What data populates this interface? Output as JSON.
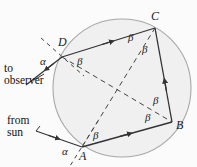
{
  "figure": {
    "background_color": "#fbfbfb",
    "circle": {
      "cx": 122,
      "cy": 88,
      "r": 69,
      "fill": "#f0f0f0",
      "stroke": "#a8a8a8"
    },
    "line_color": "#333333",
    "dash_color": "#444444"
  },
  "vertices": [
    {
      "id": "A",
      "label": "A",
      "x": 82,
      "y": 147
    },
    {
      "id": "B",
      "label": "B",
      "x": 172,
      "y": 122
    },
    {
      "id": "C",
      "label": "C",
      "x": 155,
      "y": 28
    },
    {
      "id": "D",
      "label": "D",
      "x": 62,
      "y": 57
    }
  ],
  "angle_labels": [
    {
      "id": "alpha-D",
      "text": "α",
      "x": 47,
      "y": 62
    },
    {
      "id": "beta-D",
      "text": "β",
      "x": 81,
      "y": 62
    },
    {
      "id": "beta-C-left",
      "text": "β",
      "x": 131,
      "y": 38
    },
    {
      "id": "beta-C-right",
      "text": "β",
      "x": 145,
      "y": 50
    },
    {
      "id": "beta-B-upper",
      "text": "β",
      "x": 156,
      "y": 101
    },
    {
      "id": "beta-B-lower",
      "text": "β",
      "x": 148,
      "y": 118
    },
    {
      "id": "beta-A",
      "text": "β",
      "x": 96,
      "y": 136
    },
    {
      "id": "alpha-A",
      "text": "α",
      "x": 66,
      "y": 152
    }
  ],
  "ray_labels": [
    {
      "id": "to-observer",
      "line1": "to",
      "line2": "observer",
      "x": 4,
      "y": 70
    },
    {
      "id": "from-sun",
      "line1": "from",
      "line2": "sun",
      "x": 12,
      "y": 122
    }
  ],
  "symbols": {
    "alpha": "α",
    "beta": "β"
  },
  "geometry": {
    "solid_sides": [
      {
        "id": "side-DC",
        "from": "D",
        "to": "C",
        "arrow_at_mid": true
      },
      {
        "id": "side-CB",
        "from": "C",
        "to": "B",
        "arrow_at_mid": true
      },
      {
        "id": "side-AB",
        "from": "A",
        "to": "B",
        "arrow_at_mid": true
      }
    ],
    "dashed_diagonals": [
      {
        "id": "diagonal-AC",
        "from": "A",
        "to": "C"
      },
      {
        "id": "diagonal-DB",
        "from": "D",
        "to": "B"
      }
    ],
    "incoming_ray": {
      "id": "ray-from-sun",
      "x1": 36,
      "y1": 131,
      "x2": 82,
      "y2": 147
    },
    "outgoing_ray": {
      "id": "ray-to-observer",
      "x1": 62,
      "y1": 57,
      "x2": 26,
      "y2": 85
    },
    "normal_at_D": {
      "id": "normal-D",
      "x1": 41,
      "y1": 38,
      "x2": 84,
      "y2": 76
    },
    "normal_at_A": {
      "id": "normal-A",
      "x1": 98,
      "y1": 121,
      "x2": 70,
      "y2": 166
    }
  }
}
